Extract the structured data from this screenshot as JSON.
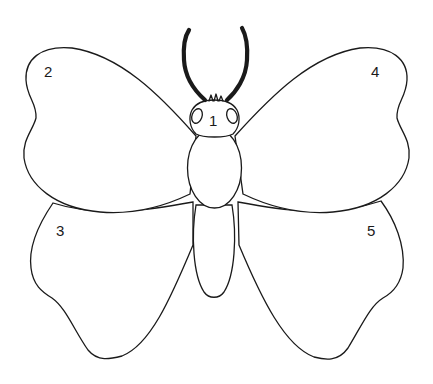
{
  "diagram": {
    "labels": [
      {
        "id": "1",
        "text": "1",
        "part": "head"
      },
      {
        "id": "2",
        "text": "2",
        "part": "left-forewing"
      },
      {
        "id": "3",
        "text": "3",
        "part": "left-hindwing"
      },
      {
        "id": "4",
        "text": "4",
        "part": "right-forewing"
      },
      {
        "id": "5",
        "text": "5",
        "part": "right-hindwing"
      }
    ],
    "colors": {
      "outline": "#1a1a1a",
      "background": "#ffffff"
    }
  }
}
